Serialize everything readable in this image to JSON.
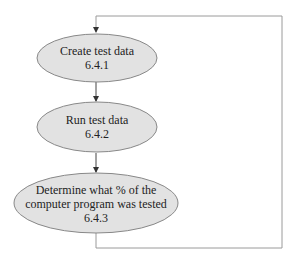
{
  "diagram": {
    "type": "flowchart",
    "colors": {
      "node_fill": "#e2e2e2",
      "node_stroke": "#888888",
      "edge": "#555555",
      "loop_edge": "#999999",
      "text": "#222222"
    },
    "nodes": [
      {
        "id": "6.4.1",
        "lines": [
          "Create test data",
          "6.4.1"
        ]
      },
      {
        "id": "6.4.2",
        "lines": [
          "Run test data",
          "6.4.2"
        ]
      },
      {
        "id": "6.4.3",
        "lines": [
          "Determine what % of the",
          "computer program was tested",
          "6.4.3"
        ]
      }
    ],
    "edges": [
      {
        "from": "loop",
        "to": "6.4.1"
      },
      {
        "from": "6.4.1",
        "to": "6.4.2"
      },
      {
        "from": "6.4.2",
        "to": "6.4.3"
      },
      {
        "from": "6.4.3",
        "to": "6.4.1",
        "label": "loop back"
      }
    ]
  }
}
